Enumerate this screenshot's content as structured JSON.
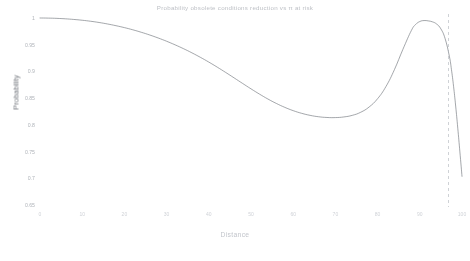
{
  "chart_data": {
    "type": "line",
    "title": "Probability obsolete conditions reduction vs π at risk",
    "xlabel": "Distance",
    "ylabel": "Probability",
    "grid": false,
    "legend": null,
    "xlim": [
      0,
      100
    ],
    "ylim": [
      0.65,
      1.0
    ],
    "xticks": [
      "0",
      "10",
      "20",
      "30",
      "40",
      "50",
      "60",
      "70",
      "80",
      "90",
      "100"
    ],
    "yticks": [
      "1",
      "0.95",
      "0.9",
      "0.85",
      "0.8",
      "0.75",
      "0.7",
      "0.65"
    ],
    "line_color": "#6b6f76",
    "series": [
      {
        "name": "Probability",
        "x": [
          0,
          2,
          4,
          6,
          8,
          10,
          12,
          14,
          16,
          18,
          20,
          22,
          24,
          26,
          28,
          30,
          32,
          34,
          36,
          38,
          40,
          42,
          44,
          46,
          48,
          50,
          52,
          54,
          56,
          58,
          60,
          62,
          64,
          66,
          68,
          70,
          72,
          74,
          76,
          78,
          80,
          82,
          84,
          86,
          88,
          89,
          90,
          91,
          92,
          93,
          94,
          95,
          96,
          97,
          97.5,
          98,
          98.5,
          99,
          99.5,
          100
        ],
        "values": [
          1.0,
          0.9998,
          0.9993,
          0.9985,
          0.9973,
          0.9958,
          0.9939,
          0.9916,
          0.9888,
          0.9856,
          0.982,
          0.9779,
          0.9733,
          0.9682,
          0.9626,
          0.9565,
          0.9498,
          0.9426,
          0.9348,
          0.9264,
          0.9175,
          0.908,
          0.8981,
          0.8879,
          0.8776,
          0.8674,
          0.8576,
          0.8484,
          0.8401,
          0.8328,
          0.8266,
          0.8216,
          0.8178,
          0.8152,
          0.8138,
          0.8136,
          0.8148,
          0.8178,
          0.8236,
          0.8335,
          0.849,
          0.872,
          0.9036,
          0.9414,
          0.9766,
          0.9877,
          0.9934,
          0.9952,
          0.9946,
          0.9928,
          0.9886,
          0.9796,
          0.9614,
          0.9286,
          0.9035,
          0.8722,
          0.8352,
          0.7938,
          0.7494,
          0.7036
        ]
      }
    ],
    "annotations": [
      {
        "type": "vertical-dashed-line",
        "name": "threshold-line",
        "x": 96.8,
        "color": "#a8acb3",
        "dash": "3 3"
      }
    ]
  },
  "axes": {
    "y_label": "Probability",
    "x_label": "Distance"
  }
}
